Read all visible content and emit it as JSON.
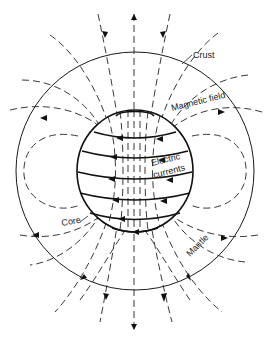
{
  "diagram": {
    "type": "earth-magnetic-field-cross-section",
    "labels": {
      "crust": "Crust",
      "magnetic_field": "Magnetic field",
      "electric_line1": "Electric",
      "electric_line2": "currents",
      "core": "Core",
      "mantle": "Mantle"
    },
    "colors": {
      "ink": "#1a1a1a",
      "background": "#ffffff"
    }
  }
}
